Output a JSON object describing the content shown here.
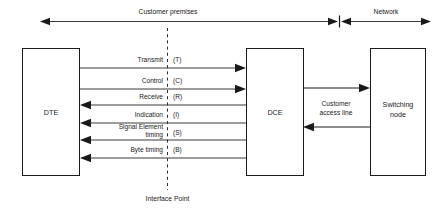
{
  "figure": {
    "zones": {
      "customer_premises_label": "Customer premises",
      "network_label": "Network"
    },
    "nodes": {
      "dte_label": "DTE",
      "dce_label": "DCE",
      "switching_node_line1": "Switching",
      "switching_node_line2": "node"
    },
    "signals": [
      {
        "name": "Transmit",
        "code": "(T)",
        "direction": "dte-to-dce"
      },
      {
        "name": "Control",
        "code": "(C)",
        "direction": "dte-to-dce"
      },
      {
        "name": "Receive",
        "code": "(R)",
        "direction": "dce-to-dte"
      },
      {
        "name": "Indication",
        "code": "(I)",
        "direction": "dce-to-dte"
      },
      {
        "name": "Signal Element",
        "name_line2": "timing",
        "code": "(S)",
        "direction": "dce-to-dte"
      },
      {
        "name": "Byte timing",
        "code": "(B)",
        "direction": "dce-to-dte"
      }
    ],
    "access_link": {
      "label_line1": "Customer",
      "label_line2": "access line"
    },
    "interface": {
      "label": "Interface Point"
    },
    "colors": {
      "stroke": "#1a1a1a",
      "signal_stroke": "#3a3a3a",
      "background": "#ffffff",
      "text": "#1a1a1a"
    }
  }
}
